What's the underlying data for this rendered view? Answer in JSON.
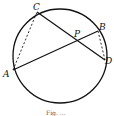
{
  "diagram": {
    "points": {
      "A": {
        "label": "A"
      },
      "B": {
        "label": "B"
      },
      "C": {
        "label": "C"
      },
      "D": {
        "label": "D"
      },
      "P": {
        "label": "P"
      }
    },
    "segments": [
      {
        "from": "A",
        "to": "B",
        "style": "solid"
      },
      {
        "from": "C",
        "to": "D",
        "style": "solid"
      },
      {
        "from": "A",
        "to": "C",
        "style": "dashed"
      },
      {
        "from": "B",
        "to": "D",
        "style": "dashed"
      }
    ],
    "caption": "Fig. ..."
  }
}
